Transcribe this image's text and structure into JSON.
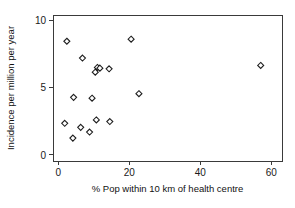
{
  "chart_data": {
    "type": "scatter",
    "title": "",
    "xlabel": "% Pop  within 10 km of health centre",
    "ylabel": "Incidence per million per year",
    "xlim": [
      -1.5,
      63
    ],
    "ylim": [
      -0.45,
      10.4
    ],
    "xticks": [
      0,
      20,
      40,
      60
    ],
    "xtick_labels": [
      "0",
      "20",
      "40",
      "60"
    ],
    "yticks": [
      0,
      5,
      10
    ],
    "ytick_labels": [
      "0",
      "5",
      "10"
    ],
    "grid": false,
    "legend": "none",
    "marker": "diamond-open",
    "marker_color": "#1f1f1f",
    "marker_fill": "#ffffff",
    "axis_color": "#3a3a3a",
    "background": "#ffffff",
    "points": [
      {
        "x": 2.4,
        "y": 8.45
      },
      {
        "x": 20.5,
        "y": 8.6
      },
      {
        "x": 6.8,
        "y": 7.2
      },
      {
        "x": 57.0,
        "y": 6.65
      },
      {
        "x": 11.0,
        "y": 6.5
      },
      {
        "x": 11.7,
        "y": 6.45
      },
      {
        "x": 10.4,
        "y": 6.15
      },
      {
        "x": 14.3,
        "y": 6.4
      },
      {
        "x": 4.3,
        "y": 4.28
      },
      {
        "x": 9.5,
        "y": 4.22
      },
      {
        "x": 22.7,
        "y": 4.55
      },
      {
        "x": 1.8,
        "y": 2.35
      },
      {
        "x": 10.7,
        "y": 2.6
      },
      {
        "x": 14.5,
        "y": 2.48
      },
      {
        "x": 6.3,
        "y": 2.05
      },
      {
        "x": 8.8,
        "y": 1.7
      },
      {
        "x": 4.1,
        "y": 1.25
      }
    ]
  },
  "axes": {
    "y_title": "Incidence per million per year",
    "x_title": "% Pop  within 10 km of health centre"
  }
}
